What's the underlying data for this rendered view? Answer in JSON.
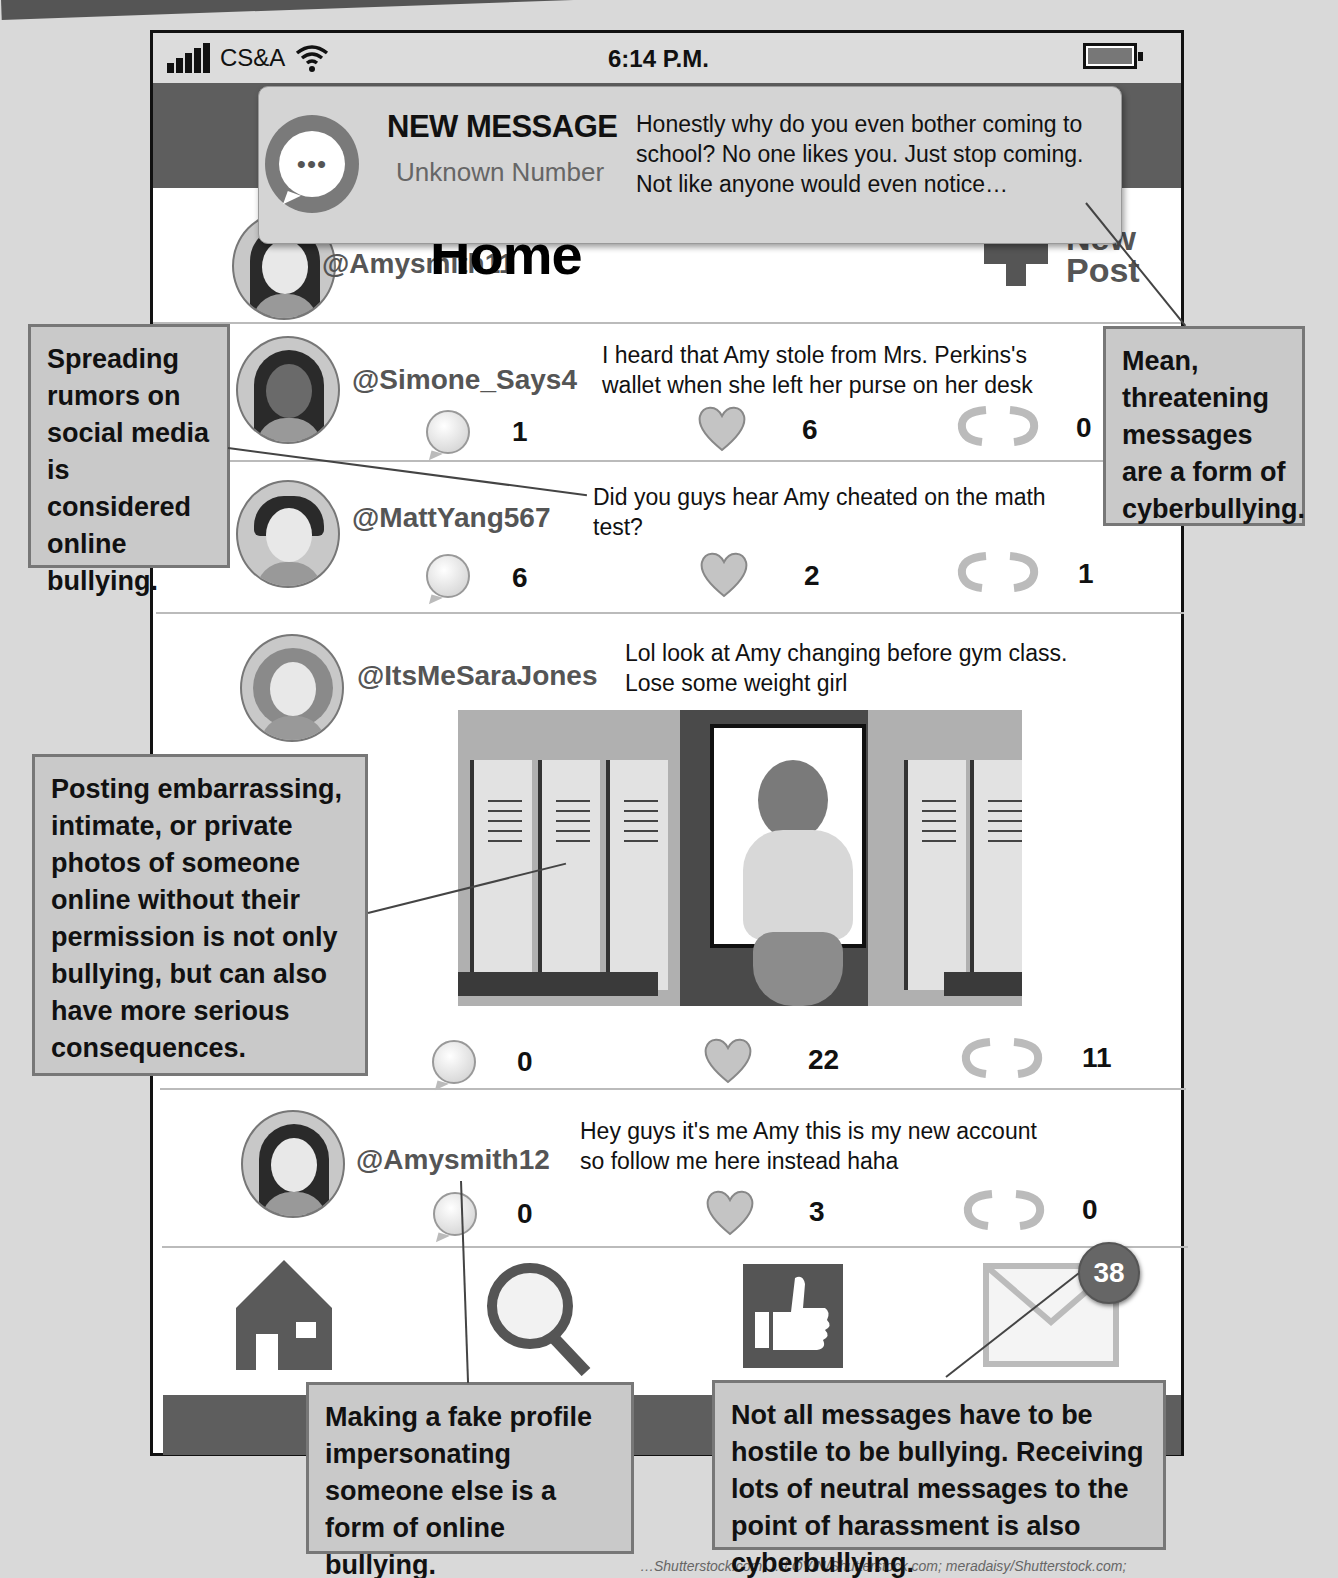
{
  "status_bar": {
    "carrier": "CS&A",
    "time": "6:14 P.M.",
    "signal_icon": "signal-bars-icon",
    "wifi_icon": "wifi-icon",
    "battery_icon": "battery-icon"
  },
  "notification": {
    "title": "NEW MESSAGE",
    "sender": "Unknown Number",
    "message": "Honestly why do you even bother coming to school? No one likes you. Just stop coming. Not like anyone would even notice…",
    "icon": "chat-bubble-icon",
    "icon_glyph": "•••"
  },
  "header": {
    "user_handle": "@Amysmith11",
    "title": "Home",
    "new_post_label_line1": "New",
    "new_post_label_line2": "Post"
  },
  "posts": [
    {
      "handle": "@Simone_Says4",
      "text": "I heard that Amy stole from Mrs. Perkins's wallet when she left her purse on her desk",
      "comments": "1",
      "likes": "6",
      "reposts": "0"
    },
    {
      "handle": "@MattYang567",
      "text": "Did you guys hear Amy cheated on the math test?",
      "comments": "6",
      "likes": "2",
      "reposts": "1"
    },
    {
      "handle": "@ItsMeSaraJones",
      "text": "Lol look at Amy changing before gym class. Lose some weight girl",
      "comments": "0",
      "likes": "22",
      "reposts": "11",
      "image": "locker-room-photo"
    },
    {
      "handle": "@Amysmith12",
      "text": "Hey guys it's me Amy this is my new account so follow me here instead haha",
      "comments": "0",
      "likes": "3",
      "reposts": "0"
    }
  ],
  "nav_bar": {
    "items": [
      "home-icon",
      "search-icon",
      "thumbs-up-icon",
      "mail-icon"
    ],
    "mail_badge": "38"
  },
  "callouts": {
    "rumors": "Spreading rumors on social media is considered online bullying.",
    "threatening": "Mean, threatening messages are a form of cyberbullying.",
    "photos": "Posting embarrassing, intimate, or private photos of someone online without their permission is not only bullying, but can also have more serious consequences.",
    "fake_profile": "Making a fake profile impersonating someone else is a form of online bullying.",
    "neutral_messages": "Not all messages have to be hostile to be bullying. Receiving lots of neutral messages to the point of harassment is also cyberbullying."
  },
  "credit": "…Shutterstock.com; …LOVIN/Shutterstock.com; meradaisy/Shutterstock.com;",
  "colors": {
    "dark_band": "#5e5e5e",
    "callout_bg": "#c9c9c9",
    "status_bar_bg": "#dcdcdc",
    "handle_text": "#555555"
  }
}
